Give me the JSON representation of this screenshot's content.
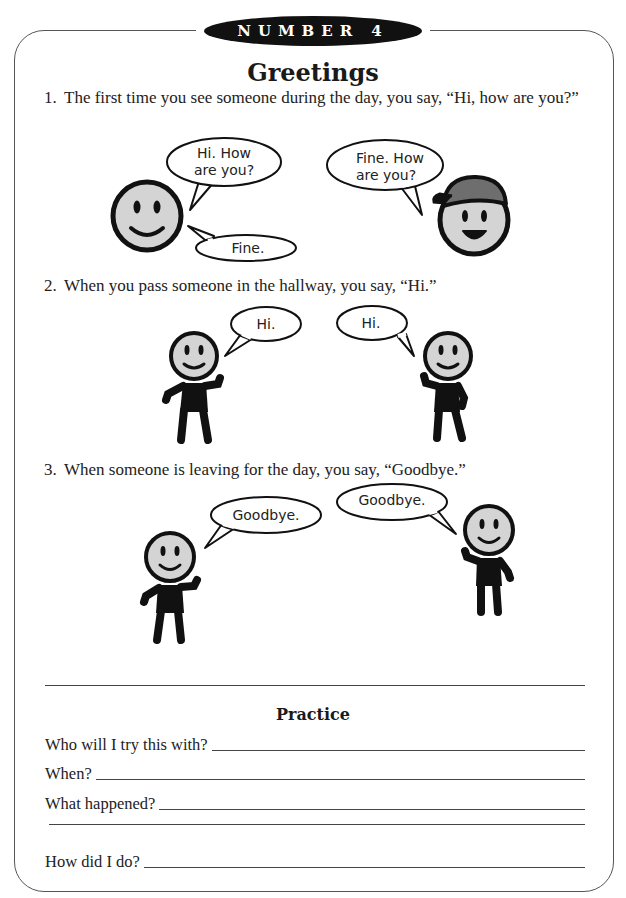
{
  "header": {
    "badge": "NUMBER 4",
    "title": "Greetings"
  },
  "items": [
    {
      "number": "1.",
      "text": "The first time you see someone during the day, you say, “Hi, how are you?”",
      "bubbles": [
        "Hi. How",
        "are you?",
        "Fine.",
        "Fine. How",
        "are you?"
      ]
    },
    {
      "number": "2.",
      "text": "When you pass someone in the hallway, you say, “Hi.”",
      "bubbles": [
        "Hi.",
        "Hi."
      ]
    },
    {
      "number": "3.",
      "text": "When someone is leaving for the day, you say, “Goodbye.”",
      "bubbles": [
        "Goodbye.",
        "Goodbye."
      ]
    }
  ],
  "practice": {
    "title": "Practice",
    "questions": [
      "Who will I try this with?",
      "When?",
      "What happened?",
      "",
      "How did I do?"
    ]
  },
  "colors": {
    "face_fill": "#d4d4d4",
    "outline": "#111111",
    "cap_fill": "#6e6e6e"
  }
}
